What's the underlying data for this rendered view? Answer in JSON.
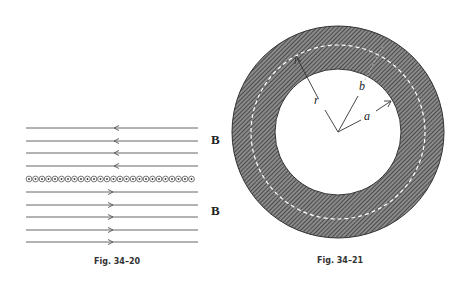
{
  "figures": [
    {
      "caption": "Fig. 34–20",
      "field_label_top": "B",
      "field_label_bottom": "B",
      "upper_lines": 4,
      "upper_direction": "left",
      "lower_lines": 5,
      "lower_direction": "right",
      "current_sheet": "wires carrying current out of page (dots)"
    },
    {
      "caption": "Fig. 34–21",
      "labels": {
        "r": "r",
        "b": "b",
        "a": "a"
      },
      "description": "Hatched annulus (coaxial conductor) with inner radius a, outer radius b, dashed circle of radius r"
    }
  ],
  "colors": {
    "line": "#444444",
    "hatch": "#555555",
    "background": "#ffffff"
  }
}
